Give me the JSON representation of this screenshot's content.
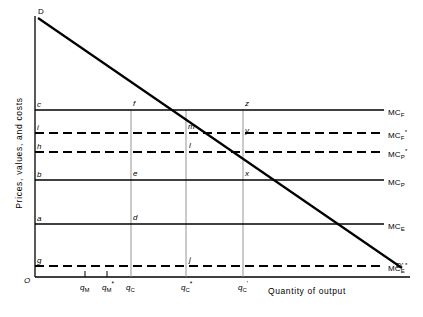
{
  "figure": {
    "axes": {
      "origin_label": "O",
      "y_title": "Prices, values, and costs",
      "x_title": "Quantity of output"
    },
    "curves": {
      "demand_start_label": "D",
      "demand_end_label": "D'"
    },
    "cost_lines": [
      {
        "id": "mcf",
        "left_label": "c",
        "right_label": "MC",
        "sub": "F",
        "sup": "",
        "style": "solid",
        "y": 110,
        "value_rank": 1
      },
      {
        "id": "mcfs",
        "left_label": "i",
        "right_label": "MC",
        "sub": "F",
        "sup": "*",
        "style": "dashed",
        "y": 133,
        "value_rank": 2
      },
      {
        "id": "mcps",
        "left_label": "h",
        "right_label": "MC",
        "sub": "P",
        "sup": "*",
        "style": "dashed",
        "y": 152,
        "value_rank": 3
      },
      {
        "id": "mcp",
        "left_label": "b",
        "right_label": "MC",
        "sub": "P",
        "sup": "",
        "style": "solid",
        "y": 180,
        "value_rank": 4
      },
      {
        "id": "mce",
        "left_label": "a",
        "right_label": "MC",
        "sub": "E",
        "sup": "",
        "style": "solid",
        "y": 224,
        "value_rank": 5
      },
      {
        "id": "mces",
        "left_label": "g",
        "right_label": "MC",
        "sub": "E",
        "sup": "*",
        "style": "dashed",
        "y": 266,
        "value_rank": 6
      }
    ],
    "x_ticks": [
      {
        "id": "qm",
        "base": "q",
        "sub": "M",
        "sup": "",
        "x": 85,
        "has_vline": false
      },
      {
        "id": "qms",
        "base": "q",
        "sub": "M",
        "sup": "*",
        "x": 107,
        "has_vline": false
      },
      {
        "id": "qc",
        "base": "q",
        "sub": "C",
        "sup": "",
        "x": 131,
        "has_vline": true
      },
      {
        "id": "qcs",
        "base": "q",
        "sub": "C",
        "sup": "*",
        "x": 186,
        "has_vline": true
      },
      {
        "id": "qcp",
        "base": "q",
        "sub": "C",
        "sup": "'",
        "x": 243,
        "has_vline": true
      }
    ],
    "point_labels": [
      {
        "id": "f",
        "text": "f",
        "x": 133,
        "y": 104
      },
      {
        "id": "z",
        "text": "z",
        "x": 245,
        "y": 104
      },
      {
        "id": "m",
        "text": "m",
        "x": 188,
        "y": 127
      },
      {
        "id": "y",
        "text": "y",
        "x": 245,
        "y": 131
      },
      {
        "id": "l",
        "text": "l",
        "x": 188,
        "y": 146
      },
      {
        "id": "e",
        "text": "e",
        "x": 133,
        "y": 174
      },
      {
        "id": "x",
        "text": "x",
        "x": 245,
        "y": 174
      },
      {
        "id": "d",
        "text": "d",
        "x": 133,
        "y": 218
      },
      {
        "id": "j",
        "text": "j",
        "x": 188,
        "y": 260
      }
    ],
    "colors": {
      "ink": "#000000",
      "background": "#ffffff",
      "guide": "#808080"
    }
  }
}
